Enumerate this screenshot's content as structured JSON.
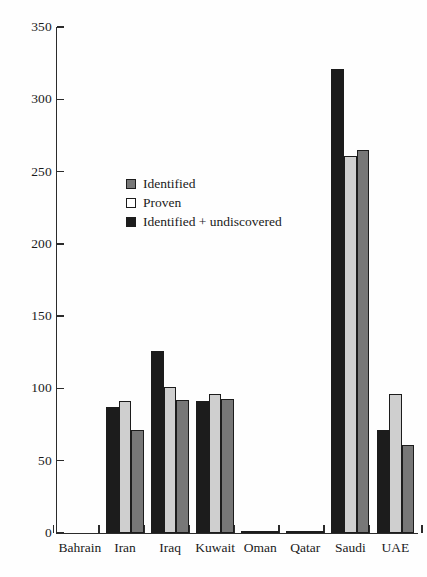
{
  "chart_data": {
    "type": "bar",
    "title": "",
    "xlabel": "",
    "ylabel": "",
    "ylim": [
      0,
      350
    ],
    "ytick_step": 50,
    "yticks": [
      "0",
      "50",
      "100",
      "150",
      "200",
      "250",
      "300",
      "350"
    ],
    "grid": false,
    "legend_position": "inside-upper-left",
    "categories": [
      "Bahrain",
      "Iran",
      "Iraq",
      "Kuwait",
      "Oman",
      "Qatar",
      "Saudi",
      "UAE"
    ],
    "series": [
      {
        "name": "Identified",
        "color": "#777777",
        "swatch": "#777777",
        "order_in_group": 3,
        "values": [
          0,
          71,
          92,
          93,
          1,
          1,
          265,
          61
        ]
      },
      {
        "name": "Proven",
        "color": "#cfcfcf",
        "swatch": "#ffffff",
        "order_in_group": 2,
        "values": [
          0,
          91,
          101,
          96,
          1,
          1,
          261,
          96
        ]
      },
      {
        "name": "Identified + undiscovered",
        "color": "#1c1c1c",
        "swatch": "#1c1c1c",
        "order_in_group": 1,
        "values": [
          0,
          87,
          126,
          91,
          1,
          1,
          321,
          71
        ]
      }
    ]
  },
  "legend": {
    "items": [
      {
        "label": "Identified"
      },
      {
        "label": "Proven"
      },
      {
        "label": "Identified + undiscovered"
      }
    ]
  },
  "axes": {
    "y_tick_labels": [
      "350",
      "300",
      "250",
      "200",
      "150",
      "100",
      "50",
      "0"
    ],
    "x_tick_labels": [
      "Bahrain",
      "Iran",
      "Iraq",
      "Kuwait",
      "Oman",
      "Qatar",
      "Saudi",
      "UAE"
    ]
  }
}
